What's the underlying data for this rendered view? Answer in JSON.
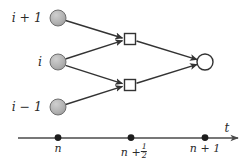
{
  "figure": {
    "type": "stencil-diagram",
    "caption_text": "",
    "colors": {
      "node_fill_gray": "#b0b0b0",
      "node_fill_white": "#ffffff",
      "stroke": "#333333",
      "text": "#2b2b2b",
      "background": "#ffffff"
    },
    "space_axis": {
      "labels": [
        {
          "id": "i-plus-1",
          "text": "i + 1",
          "x": 42,
          "y": 18
        },
        {
          "id": "i",
          "text": "i",
          "x": 42,
          "y": 62
        },
        {
          "id": "i-minus-1",
          "text": "i − 1",
          "x": 42,
          "y": 107
        }
      ]
    },
    "nodes": [
      {
        "id": "node-i-plus-1-n",
        "shape": "circle",
        "fill": "gray",
        "cx": 58,
        "cy": 18,
        "r": 8
      },
      {
        "id": "node-i-n",
        "shape": "circle",
        "fill": "gray",
        "cx": 58,
        "cy": 62,
        "r": 8
      },
      {
        "id": "node-i-minus-1-n",
        "shape": "circle",
        "fill": "gray",
        "cx": 58,
        "cy": 107,
        "r": 8
      },
      {
        "id": "node-half-upper",
        "shape": "square",
        "fill": "white",
        "cx": 130,
        "cy": 39,
        "size": 11
      },
      {
        "id": "node-half-lower",
        "shape": "square",
        "fill": "white",
        "cx": 130,
        "cy": 85,
        "size": 11
      },
      {
        "id": "node-i-n-plus-1",
        "shape": "circle",
        "fill": "white",
        "cx": 205,
        "cy": 62,
        "r": 8
      }
    ],
    "edges": [
      {
        "id": "edge-top-to-upper-square",
        "from": "node-i-plus-1-n",
        "to": "node-half-upper",
        "arrow": true
      },
      {
        "id": "edge-mid-to-upper-square",
        "from": "node-i-n",
        "to": "node-half-upper",
        "arrow": true
      },
      {
        "id": "edge-mid-to-lower-square",
        "from": "node-i-n",
        "to": "node-half-lower",
        "arrow": true
      },
      {
        "id": "edge-bottom-to-lower-square",
        "from": "node-i-minus-1-n",
        "to": "node-half-lower",
        "arrow": true
      },
      {
        "id": "edge-upper-square-to-right",
        "from": "node-half-upper",
        "to": "node-i-n-plus-1",
        "arrow": true
      },
      {
        "id": "edge-lower-square-to-right",
        "from": "node-half-lower",
        "to": "node-i-n-plus-1",
        "arrow": true
      }
    ],
    "time_axis": {
      "label": "t",
      "label_x": 227,
      "label_y": 128,
      "line_y": 138,
      "x_start": 18,
      "x_end": 241,
      "ticks": [
        {
          "id": "tick-n",
          "text": "n",
          "x": 58,
          "fraction": null
        },
        {
          "id": "tick-n-plus-half",
          "text": "n +",
          "x": 131,
          "fraction": {
            "num": "1",
            "den": "2"
          }
        },
        {
          "id": "tick-n-plus-1",
          "text": "n + 1",
          "x": 205,
          "fraction": null
        }
      ]
    }
  }
}
